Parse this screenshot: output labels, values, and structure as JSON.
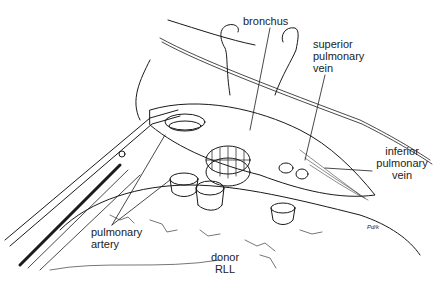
{
  "figure": {
    "labels": {
      "bronchus": "bronchus",
      "superior_pulmonary_vein": [
        "superior",
        "pulmonary",
        "vein"
      ],
      "inferior_pulmonary_vein": [
        "inferior",
        "pulmonary",
        "vein"
      ],
      "pulmonary_artery": [
        "pulmonary",
        "artery"
      ],
      "donor_rll": [
        "donor",
        "RLL"
      ]
    },
    "signature": "Pd/k",
    "colors": {
      "ink": "#1a1a1a",
      "background": "#ffffff"
    }
  }
}
